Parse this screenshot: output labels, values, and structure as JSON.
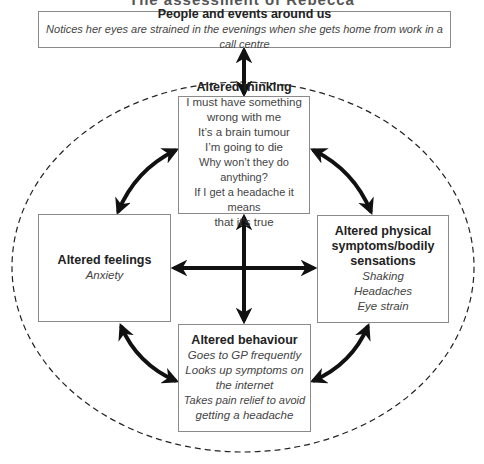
{
  "title": "The assessment of Rebecca",
  "boxes": {
    "people": {
      "heading": "People and events around us",
      "lines": [
        "Notices her eyes are strained in the evenings when she gets home from work in a call centre"
      ]
    },
    "thinking": {
      "heading": "Altered thinking",
      "lines": [
        "I must have something",
        "wrong with me",
        "It’s a brain tumour",
        "I’m going to die",
        "Why won’t they do anything?",
        "If I get a headache it means",
        "that it’s true"
      ]
    },
    "feelings": {
      "heading": "Altered feelings",
      "lines": [
        "Anxiety"
      ]
    },
    "physical": {
      "heading_lines": [
        "Altered physical",
        "symptoms/bodily",
        "sensations"
      ],
      "lines": [
        "Shaking",
        "Headaches",
        "Eye strain"
      ]
    },
    "behaviour": {
      "heading": "Altered behaviour",
      "lines": [
        "Goes to GP frequently",
        "Looks up symptoms on",
        "the internet",
        "Takes pain relief to avoid",
        "getting a headache"
      ]
    }
  },
  "colors": {
    "arrow": "#111111",
    "border": "#8a8a8a",
    "dash": "#222222"
  }
}
